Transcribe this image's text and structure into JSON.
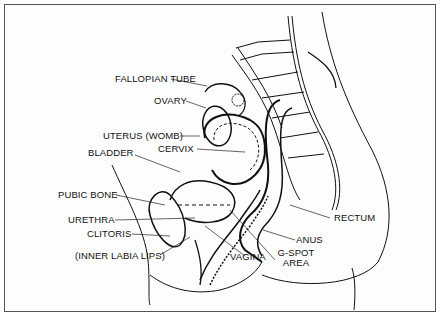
{
  "diagram": {
    "type": "anatomical cross-section",
    "labels": {
      "fallopian_tube": "FALLOPIAN TUBE",
      "ovary": "OVARY",
      "uterus": "UTERUS (WOMB)",
      "cervix": "CERVIX",
      "bladder": "BLADDER",
      "pubic_bone": "PUBIC BONE",
      "urethra": "URETHRA",
      "clitoris": "CLITORIS",
      "inner_labia": "(INNER LABIA LIPS)",
      "vagina": "VAGINA",
      "gspot_line1": "G-SPOT",
      "gspot_line2": "AREA",
      "anus": "ANUS",
      "rectum": "RECTUM"
    }
  }
}
